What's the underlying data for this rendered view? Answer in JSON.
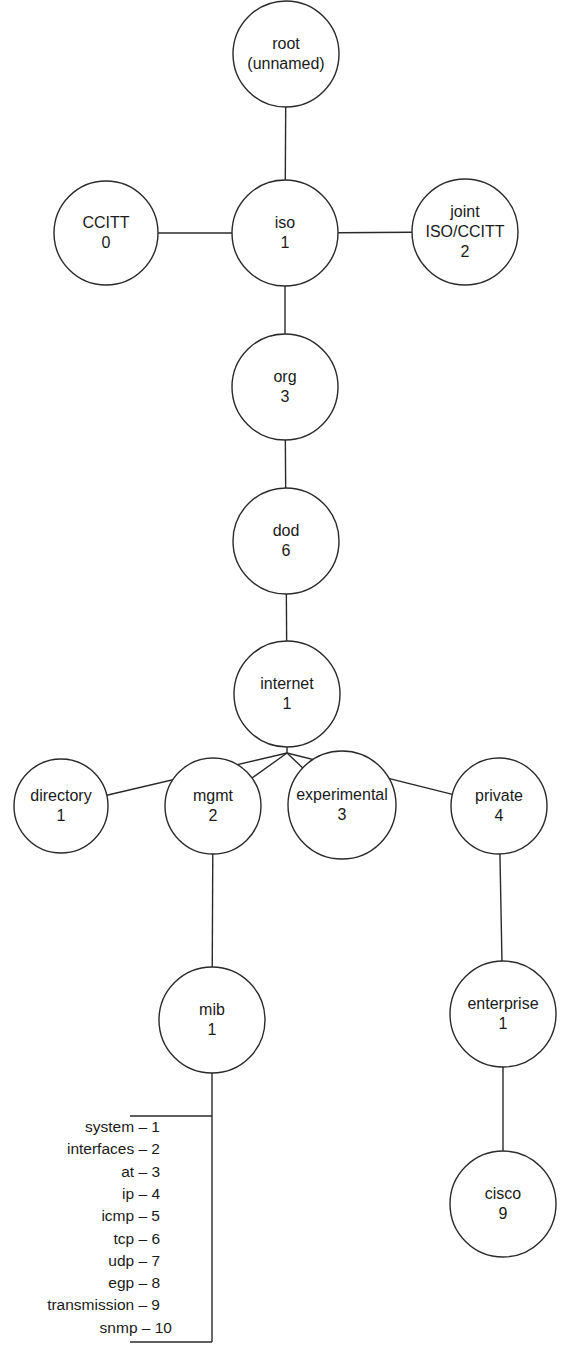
{
  "diagram": {
    "type": "tree",
    "nodes": [
      {
        "id": "root",
        "lines": [
          "root",
          "(unnamed)"
        ],
        "cx": 286,
        "cy": 54,
        "r": 53
      },
      {
        "id": "ccitt",
        "lines": [
          "CCITT",
          "0"
        ],
        "cx": 106,
        "cy": 233,
        "r": 52
      },
      {
        "id": "iso",
        "lines": [
          "iso",
          "1"
        ],
        "cx": 285,
        "cy": 233,
        "r": 53
      },
      {
        "id": "joint",
        "lines": [
          "joint",
          "ISO/CCITT",
          "2"
        ],
        "cx": 465,
        "cy": 232,
        "r": 53
      },
      {
        "id": "org",
        "lines": [
          "org",
          "3"
        ],
        "cx": 285,
        "cy": 387,
        "r": 53
      },
      {
        "id": "dod",
        "lines": [
          "dod",
          "6"
        ],
        "cx": 286,
        "cy": 541,
        "r": 53
      },
      {
        "id": "internet",
        "lines": [
          "internet",
          "1"
        ],
        "cx": 287,
        "cy": 694,
        "r": 53
      },
      {
        "id": "directory",
        "lines": [
          "directory",
          "1"
        ],
        "cx": 61,
        "cy": 806,
        "r": 47
      },
      {
        "id": "mgmt",
        "lines": [
          "mgmt",
          "2"
        ],
        "cx": 213,
        "cy": 806,
        "r": 48
      },
      {
        "id": "experimental",
        "lines": [
          "experimental",
          "3"
        ],
        "cx": 342,
        "cy": 805,
        "r": 54
      },
      {
        "id": "private",
        "lines": [
          "private",
          "4"
        ],
        "cx": 499,
        "cy": 806,
        "r": 48
      },
      {
        "id": "mib",
        "lines": [
          "mib",
          "1"
        ],
        "cx": 212,
        "cy": 1020,
        "r": 53
      },
      {
        "id": "enterprise",
        "lines": [
          "enterprise",
          "1"
        ],
        "cx": 503,
        "cy": 1014,
        "r": 53
      },
      {
        "id": "cisco",
        "lines": [
          "cisco",
          "9"
        ],
        "cx": 503,
        "cy": 1204,
        "r": 53
      }
    ],
    "edges": [
      [
        "root",
        "iso"
      ],
      [
        "ccitt",
        "iso"
      ],
      [
        "iso",
        "joint"
      ],
      [
        "iso",
        "org"
      ],
      [
        "org",
        "dod"
      ],
      [
        "dod",
        "internet"
      ],
      [
        "internet",
        "directory"
      ],
      [
        "internet",
        "mgmt"
      ],
      [
        "internet",
        "experimental"
      ],
      [
        "internet",
        "private"
      ],
      [
        "mgmt",
        "mib"
      ],
      [
        "private",
        "enterprise"
      ],
      [
        "enterprise",
        "cisco"
      ]
    ],
    "mib_groups": [
      "system – 1",
      "interfaces – 2",
      "at – 3",
      "ip – 4",
      "icmp – 5",
      "tcp – 6",
      "udp – 7",
      "egp – 8",
      "transmission – 9",
      "snmp – 10"
    ],
    "colors": {
      "line": "#2a2a2a",
      "text": "#1a1a1a",
      "background": "#ffffff"
    }
  }
}
